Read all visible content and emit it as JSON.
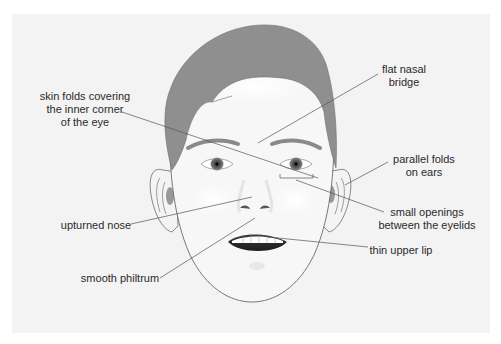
{
  "diagram": {
    "colors": {
      "background": "#ffffff",
      "panel": "#f3f3f3",
      "hair": "#8f8f8f",
      "skin": "#f6f6f6",
      "outline": "#6a6a6a",
      "leader_line": "#555555",
      "text": "#2a2a2a"
    },
    "labels": {
      "inner_eye_folds": {
        "line1": "skin folds covering",
        "line2": "the inner corner",
        "line3": "of the eye"
      },
      "nasal_bridge": {
        "line1": "flat nasal",
        "line2": "bridge"
      },
      "ear_folds": {
        "line1": "parallel folds",
        "line2": "on ears"
      },
      "eye_openings": {
        "line1": "small openings",
        "line2": "between the eyelids"
      },
      "nose": {
        "line1": "upturned nose"
      },
      "upper_lip": {
        "line1": "thin upper lip"
      },
      "philtrum": {
        "line1": "smooth philtrum"
      }
    }
  }
}
